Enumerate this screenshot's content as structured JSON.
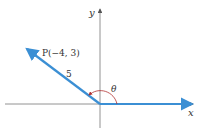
{
  "diagram": {
    "axes": {
      "x_label": "x",
      "y_label": "y"
    },
    "point": {
      "label": "P(−4, 3)",
      "x": -4,
      "y": 3
    },
    "radius_label": "5",
    "angle_label": "θ",
    "colors": {
      "ray": "#3b8fd4",
      "axis": "#555555",
      "arc": "#b03030"
    }
  }
}
